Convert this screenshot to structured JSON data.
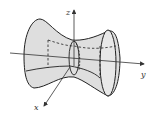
{
  "diagram": {
    "axes": {
      "x_label": "x",
      "y_label": "y",
      "z_label": "z"
    },
    "colors": {
      "surface_fill": "#d9d9d9",
      "outline": "#222222",
      "axis": "#333333"
    }
  }
}
